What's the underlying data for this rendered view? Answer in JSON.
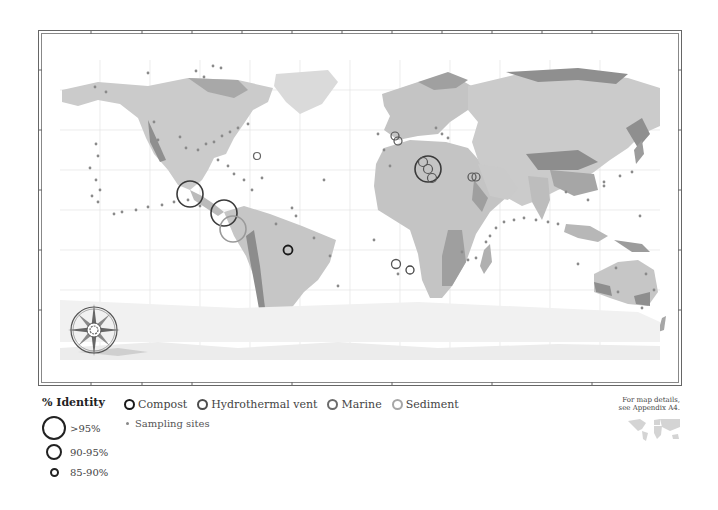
{
  "map": {
    "land_color": "#c9c9c9",
    "highland_color": "#9a9a9a",
    "ice_color": "#e6e6e6",
    "grid_color": "#e2e2e2",
    "frame_color": "#555555",
    "compass_icon": "compass-rose-icon"
  },
  "legend": {
    "identity": {
      "title": "% Identity",
      "levels": [
        {
          "label": ">95%",
          "size": 24
        },
        {
          "label": "90-95%",
          "size": 16
        },
        {
          "label": "85-90%",
          "size": 9
        }
      ]
    },
    "types": [
      {
        "label": "Compost",
        "color": "#1a1a1a"
      },
      {
        "label": "Hydrothermal vent",
        "color": "#4d4d4d"
      },
      {
        "label": "Marine",
        "color": "#6b6b6b"
      },
      {
        "label": "Sediment",
        "color": "#a6a6a6"
      }
    ],
    "sampling_sites": "Sampling sites"
  },
  "appendix": {
    "line1": "For map details,",
    "line2": "see Appendix A4."
  },
  "markers": [
    {
      "x": 190,
      "y": 194,
      "r": 13,
      "type": "Hydrothermal vent"
    },
    {
      "x": 224,
      "y": 213,
      "r": 13,
      "type": "Hydrothermal vent"
    },
    {
      "x": 233,
      "y": 229,
      "r": 13,
      "type": "Sediment"
    },
    {
      "x": 288,
      "y": 250,
      "r": 4.5,
      "type": "Compost"
    },
    {
      "x": 257,
      "y": 156,
      "r": 3.5,
      "type": "Marine"
    },
    {
      "x": 395,
      "y": 136,
      "r": 4,
      "type": "Marine"
    },
    {
      "x": 398,
      "y": 141,
      "r": 4,
      "type": "Marine"
    },
    {
      "x": 428,
      "y": 169,
      "r": 13,
      "type": "Hydrothermal vent"
    },
    {
      "x": 423,
      "y": 162,
      "r": 4.5,
      "type": "Marine"
    },
    {
      "x": 428,
      "y": 169,
      "r": 4.5,
      "type": "Marine"
    },
    {
      "x": 432,
      "y": 178,
      "r": 4.5,
      "type": "Marine"
    },
    {
      "x": 472,
      "y": 177,
      "r": 4,
      "type": "Marine"
    },
    {
      "x": 476,
      "y": 177,
      "r": 4,
      "type": "Marine"
    },
    {
      "x": 396,
      "y": 264,
      "r": 4.5,
      "type": "Marine"
    },
    {
      "x": 410,
      "y": 270,
      "r": 4,
      "type": "Hydrothermal vent"
    }
  ]
}
